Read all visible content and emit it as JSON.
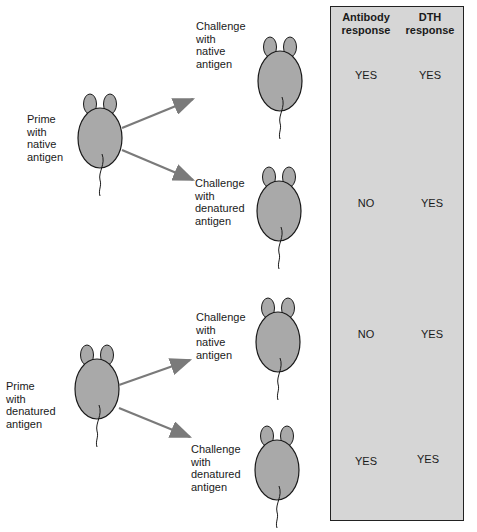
{
  "colors": {
    "mouse_fill": "#a9a9a9",
    "panel_fill": "#d6d6d6",
    "arrow": "#7a7a7a",
    "outline": "#1a1a1a"
  },
  "groups": [
    {
      "prime_label": "Prime\nwith\nnative\nantigen",
      "challenges": [
        {
          "label": "Challenge\nwith\nnative\nantigen",
          "antibody": "YES",
          "dth": "YES"
        },
        {
          "label": "Challenge\nwith\ndenatured\nantigen",
          "antibody": "NO",
          "dth": "YES"
        }
      ]
    },
    {
      "prime_label": "Prime\nwith\ndenatured\nantigen",
      "challenges": [
        {
          "label": "Challenge\nwith\nnative\nantigen",
          "antibody": "NO",
          "dth": "YES"
        },
        {
          "label": "Challenge\nwith\ndenatured\nantigen",
          "antibody": "YES",
          "dth": "YES"
        }
      ]
    }
  ],
  "table": {
    "headers": [
      "Antibody\nresponse",
      "DTH\nresponse"
    ]
  }
}
